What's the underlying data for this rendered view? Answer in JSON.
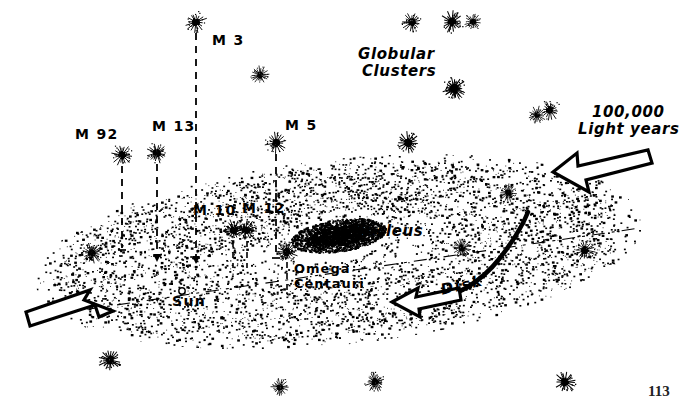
{
  "figure": {
    "kind": "milky-way-galaxy-schematic",
    "page_number": "113",
    "background_color": "#ffffff",
    "ink_color": "#000000"
  },
  "labels": {
    "globular_clusters": "Globular\nClusters",
    "globular_clusters_line1": "Globular",
    "globular_clusters_line2": "Clusters",
    "scale_line1": "100,000",
    "scale_line2": "Light years",
    "nucleus": "Nucleus",
    "disk": "Disk",
    "sun": "Sun",
    "omega_line1": "Omega",
    "omega_line2": "Centauri",
    "m92": "M 92",
    "m13": "M 13",
    "m3": "M 3",
    "m5": "M 5",
    "m10": "M 10",
    "m12": "M 12"
  },
  "chart_data": {
    "type": "scatter",
    "xlabel": "",
    "ylabel": "",
    "annotations": [
      {
        "name": "Globular Clusters",
        "x": 398,
        "y": 56
      },
      {
        "name": "100,000 Light years",
        "x": 584,
        "y": 113
      },
      {
        "name": "Nucleus",
        "x": 352,
        "y": 232
      },
      {
        "name": "Disk",
        "x": 442,
        "y": 290
      },
      {
        "name": "Sun",
        "x": 181,
        "y": 300
      },
      {
        "name": "Omega Centauri",
        "x": 293,
        "y": 271
      },
      {
        "name": "M 92",
        "x": 76,
        "y": 131
      },
      {
        "name": "M 13",
        "x": 155,
        "y": 124
      },
      {
        "name": "M 3",
        "x": 213,
        "y": 37
      },
      {
        "name": "M 5",
        "x": 286,
        "y": 122
      },
      {
        "name": "M 10",
        "x": 196,
        "y": 207
      },
      {
        "name": "M 12",
        "x": 244,
        "y": 205
      }
    ],
    "marked_clusters": [
      {
        "label": "M 92",
        "cx": 122,
        "cy": 155,
        "plumb_to_y": 246
      },
      {
        "label": "M 13",
        "cx": 157,
        "cy": 153,
        "plumb_to_y": 252
      },
      {
        "label": "M 3",
        "cx": 196,
        "cy": 22,
        "plumb_to_y": 252
      },
      {
        "label": "M 5",
        "cx": 276,
        "cy": 143,
        "plumb_to_y": 253
      },
      {
        "label": "M 10",
        "cx": 234,
        "cy": 230,
        "plumb_to_y": 265
      },
      {
        "label": "M 12",
        "cx": 246,
        "cy": 230,
        "plumb_to_y": 265
      },
      {
        "label": "Omega Centauri",
        "cx": 287,
        "cy": 252,
        "plumb_to_y": 268
      }
    ],
    "field_clusters": [
      {
        "cx": 260,
        "cy": 75
      },
      {
        "cx": 412,
        "cy": 22
      },
      {
        "cx": 452,
        "cy": 22
      },
      {
        "cx": 473,
        "cy": 22
      },
      {
        "cx": 455,
        "cy": 90
      },
      {
        "cx": 454,
        "cy": 88
      },
      {
        "cx": 537,
        "cy": 115
      },
      {
        "cx": 550,
        "cy": 110
      },
      {
        "cx": 408,
        "cy": 143
      },
      {
        "cx": 508,
        "cy": 193
      },
      {
        "cx": 585,
        "cy": 250
      },
      {
        "cx": 110,
        "cy": 360
      },
      {
        "cx": 280,
        "cy": 387
      },
      {
        "cx": 375,
        "cy": 382
      },
      {
        "cx": 565,
        "cy": 382
      },
      {
        "cx": 462,
        "cy": 248
      },
      {
        "cx": 92,
        "cy": 253
      }
    ],
    "sun": {
      "cx": 182,
      "cy": 291,
      "r": 3.2
    },
    "nucleus": {
      "cx": 339,
      "cy": 236,
      "rx": 48,
      "ry": 16,
      "angle_deg": -8
    },
    "disk": {
      "cx": 339,
      "cy": 252,
      "rx": 305,
      "ry": 93,
      "angle_deg": -6
    },
    "plane_line": {
      "x1": 28,
      "y1": 318,
      "x2": 640,
      "y2": 228
    },
    "arrows": [
      {
        "name": "scale-arrow-upper-right",
        "points_toward": "down-left",
        "tail_x": 648,
        "tail_y": 152,
        "head_x": 552,
        "head_y": 187
      },
      {
        "name": "scale-arrow-lower-left",
        "points_toward": "up-right",
        "tail_x": 6,
        "tail_y": 333,
        "head_x": 112,
        "head_y": 310
      },
      {
        "name": "disk-arrow",
        "points_toward": "left",
        "tail_x": 455,
        "tail_y": 291,
        "head_x": 392,
        "head_y": 301
      }
    ]
  }
}
